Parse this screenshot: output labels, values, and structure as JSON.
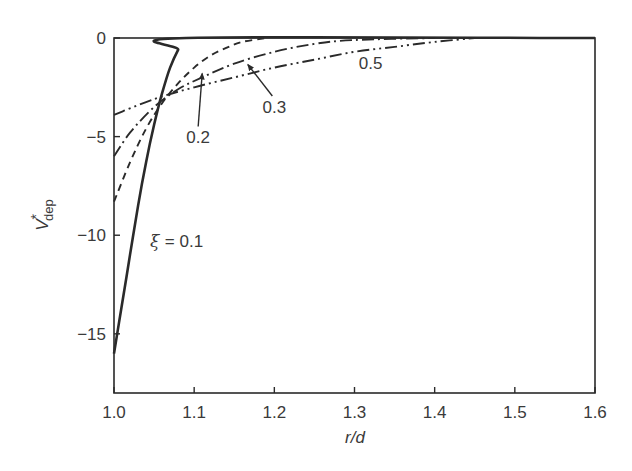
{
  "chart_data": {
    "type": "line",
    "title": "",
    "xlabel": "r/d",
    "ylabel": "V*dep",
    "ylabel_parts": {
      "main": "V",
      "sup": "*",
      "sub": "dep"
    },
    "xlim": [
      1.0,
      1.6
    ],
    "ylim": [
      -18,
      0
    ],
    "xticks": [
      1.0,
      1.1,
      1.2,
      1.3,
      1.4,
      1.5,
      1.6
    ],
    "xtick_labels": [
      "1.0",
      "1.1",
      "1.2",
      "1.3",
      "1.4",
      "1.5",
      "1.6"
    ],
    "yticks": [
      0,
      -5,
      -10,
      -15
    ],
    "ytick_labels": [
      "0",
      "−5",
      "−10",
      "−15"
    ],
    "grid": false,
    "legend": "none (inline annotations)",
    "series": [
      {
        "name": "ξ = 0.1",
        "style": "solid",
        "x": [
          1.0,
          1.01,
          1.02,
          1.03,
          1.04,
          1.05,
          1.06,
          1.07,
          1.08,
          1.09,
          1.6
        ],
        "values": [
          -16,
          -13.5,
          -11,
          -8.5,
          -6.3,
          -4.4,
          -2.8,
          -1.5,
          -0.6,
          0,
          0
        ]
      },
      {
        "name": "0.2",
        "style": "dashed",
        "x": [
          1.0,
          1.02,
          1.04,
          1.06,
          1.08,
          1.1,
          1.12,
          1.14,
          1.16,
          1.19
        ],
        "values": [
          -8.3,
          -6.3,
          -4.6,
          -3.3,
          -2.3,
          -1.5,
          -0.9,
          -0.5,
          -0.2,
          0
        ]
      },
      {
        "name": "0.3",
        "style": "dash-dot",
        "x": [
          1.0,
          1.02,
          1.05,
          1.08,
          1.11,
          1.15,
          1.2,
          1.25,
          1.3,
          1.4
        ],
        "values": [
          -6,
          -4.8,
          -3.5,
          -2.6,
          -2.0,
          -1.3,
          -0.7,
          -0.3,
          -0.1,
          0
        ]
      },
      {
        "name": "0.5",
        "style": "dash-dot-dot",
        "x": [
          1.0,
          1.05,
          1.1,
          1.15,
          1.2,
          1.25,
          1.3,
          1.35,
          1.4,
          1.45
        ],
        "values": [
          -3.9,
          -3.1,
          -2.5,
          -2.0,
          -1.5,
          -1.1,
          -0.7,
          -0.45,
          -0.2,
          0
        ]
      }
    ],
    "annotations": [
      {
        "text": "ξ = 0.1",
        "greek": "ξ",
        "rest": "= 0.1",
        "x": 1.045,
        "y": -10.6,
        "arrow": false
      },
      {
        "text": "0.2",
        "x": 1.105,
        "y": -5.3,
        "arrow": true,
        "arrow_to": [
          1.11,
          -1.8
        ]
      },
      {
        "text": "0.3",
        "x": 1.2,
        "y": -3.8,
        "arrow": true,
        "arrow_to": [
          1.167,
          -1.35
        ]
      },
      {
        "text": "0.5",
        "x": 1.32,
        "y": -1.55,
        "arrow": false
      }
    ]
  },
  "colors": {
    "ink": "#2a2a2a",
    "text": "#3a3a3a",
    "background": "#ffffff"
  }
}
